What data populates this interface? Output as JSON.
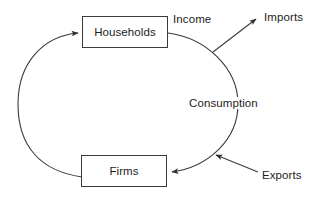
{
  "diagram": {
    "nodes": [
      {
        "id": "households",
        "label": "Households"
      },
      {
        "id": "firms",
        "label": "Firms"
      }
    ],
    "flows": [
      {
        "id": "income",
        "label": "Income"
      },
      {
        "id": "consumption",
        "label": "Consumption"
      },
      {
        "id": "imports",
        "label": "Imports"
      },
      {
        "id": "exports",
        "label": "Exports"
      }
    ],
    "colors": {
      "stroke": "#3a3a3a",
      "text": "#1d1d1d",
      "background": "#ffffff"
    }
  }
}
